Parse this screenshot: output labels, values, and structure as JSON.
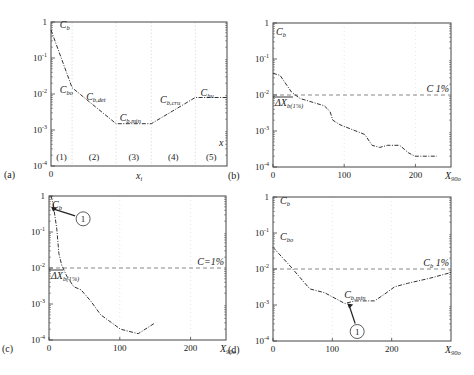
{
  "figure": {
    "width": 474,
    "height": 375,
    "background": "#ffffff",
    "line_color": "#333333",
    "axis_color": "#444444",
    "grid_color": "#cccccc"
  },
  "chart_data": [
    {
      "panel": "(a)",
      "type": "line",
      "title": "",
      "xlabel": "x_i",
      "ylabel": "C_b",
      "yscale": "log",
      "ylim": [
        0.0001,
        1
      ],
      "ytick_labels": [
        "1",
        "10^-1",
        "10^-2",
        "10^-3",
        "10^-4"
      ],
      "xtick_labels": [
        "0"
      ],
      "x_label_text": "x",
      "x_label_sub": "i",
      "corner_label": "x",
      "regions": [
        "(1)",
        "(2)",
        "(3)",
        "(4)",
        "(5)"
      ],
      "region_dividers_frac": [
        0.12,
        0.37,
        0.57,
        0.82
      ],
      "series": [
        {
          "name": "C_b",
          "style": "dash-dot",
          "x_frac": [
            0.0,
            0.12,
            0.37,
            0.57,
            0.82,
            1.0
          ],
          "values": [
            0.6,
            0.015,
            0.0015,
            0.0015,
            0.008,
            0.008
          ]
        }
      ],
      "annotations": [
        {
          "text": "C",
          "sub": "b",
          "at": [
            0.05,
            0.7
          ]
        },
        {
          "text": "C",
          "sub": "bo",
          "at": [
            0.05,
            0.011
          ]
        },
        {
          "text": "C",
          "sub": "b,det",
          "at": [
            0.2,
            0.007
          ]
        },
        {
          "text": "C",
          "sub": "b,min",
          "at": [
            0.39,
            0.0018
          ]
        },
        {
          "text": "C",
          "sub": "b,cru",
          "at": [
            0.62,
            0.0055
          ]
        },
        {
          "text": "C",
          "sub": "bu",
          "at": [
            0.85,
            0.009
          ]
        }
      ]
    },
    {
      "panel": "(b)",
      "type": "line",
      "xlabel": "X_90o",
      "ylabel": "C_b",
      "yscale": "log",
      "ylim": [
        0.0001,
        1
      ],
      "xlim": [
        0,
        250
      ],
      "ytick_labels": [
        "1",
        "10^-1",
        "10^-2",
        "10^-3",
        "10^-4"
      ],
      "xticks": [
        0,
        100,
        200
      ],
      "xtick_labels": [
        "0",
        "100",
        "200"
      ],
      "threshold": {
        "value": 0.01,
        "label": "C 1%"
      },
      "delta_label": {
        "text": "ΔX",
        "sub": "b(1%)",
        "x_end": 28
      },
      "series": [
        {
          "name": "C_b",
          "style": "dash-dot",
          "x": [
            0,
            10,
            26,
            38,
            72,
            80,
            84,
            94,
            129,
            139,
            150,
            161,
            178,
            190,
            199,
            230
          ],
          "values": [
            0.04,
            0.035,
            0.012,
            0.008,
            0.005,
            0.0035,
            0.002,
            0.0015,
            0.0008,
            0.0004,
            0.00035,
            0.0004,
            0.0004,
            0.00025,
            0.0002,
            0.0002
          ]
        }
      ]
    },
    {
      "panel": "(c)",
      "type": "line",
      "xlabel": "X_90o",
      "ylabel": "C_b",
      "yscale": "log",
      "ylim": [
        0.0001,
        1
      ],
      "xlim": [
        0,
        250
      ],
      "ytick_labels": [
        "1",
        "10^-1",
        "10^-2",
        "10^-3",
        "10^-4"
      ],
      "xticks": [
        0,
        100,
        200
      ],
      "xtick_labels": [
        "0",
        "100",
        "200"
      ],
      "threshold": {
        "value": 0.01,
        "label": "C=1%"
      },
      "delta_label": {
        "text": "ΔX",
        "sub": "b(1%)",
        "x_end": 20
      },
      "marker": {
        "label": "1",
        "target_x": 3,
        "target_y": 0.5
      },
      "series": [
        {
          "name": "C_b",
          "style": "dash-dot",
          "x": [
            3,
            6,
            11,
            14,
            18,
            25,
            35,
            45,
            59,
            73,
            101,
            126,
            150
          ],
          "values": [
            1.0,
            0.6,
            0.12,
            0.025,
            0.012,
            0.006,
            0.003,
            0.0025,
            0.0012,
            0.0005,
            0.0002,
            0.00015,
            0.0003
          ]
        }
      ]
    },
    {
      "panel": "(d)",
      "type": "line",
      "xlabel": "X_90o",
      "ylabel": "C_b",
      "yscale": "log",
      "ylim": [
        0.0001,
        1
      ],
      "xlim": [
        0,
        300
      ],
      "ytick_labels": [
        "1",
        "10^-1",
        "10^-2",
        "10^-3",
        "10^-4"
      ],
      "xticks": [
        0,
        100,
        200
      ],
      "xtick_labels": [
        "0",
        "100",
        "200"
      ],
      "threshold": {
        "value": 0.01,
        "label": "C_b 1%"
      },
      "marker": {
        "label": "1",
        "target_x": 125,
        "target_y": 0.0011
      },
      "series": [
        {
          "name": "C_b",
          "style": "dash-dot",
          "x": [
            0,
            29,
            62,
            87,
            121,
            138,
            171,
            188,
            205,
            227,
            264,
            300
          ],
          "values": [
            0.04,
            0.012,
            0.0028,
            0.0022,
            0.0011,
            0.0013,
            0.0013,
            0.002,
            0.0032,
            0.004,
            0.0055,
            0.008
          ]
        }
      ],
      "annotations": [
        {
          "text": "C",
          "sub": "b",
          "at_frac": [
            0.04,
            0.05
          ]
        },
        {
          "text": "C",
          "sub": "bo",
          "at_frac": [
            0.04,
            0.3
          ]
        },
        {
          "text": "C",
          "sub": "b,min",
          "at": [
            120,
            0.0016
          ]
        }
      ]
    }
  ],
  "panels": [
    {
      "id": "a",
      "label": "(a)",
      "box": [
        51,
        22,
        227,
        166
      ]
    },
    {
      "id": "b",
      "label": "(b)",
      "box": [
        273,
        23,
        451,
        167
      ]
    },
    {
      "id": "c",
      "label": "(c)",
      "box": [
        49,
        196,
        226,
        340
      ]
    },
    {
      "id": "d",
      "label": "(d)",
      "box": [
        273,
        197,
        451,
        341
      ]
    }
  ]
}
